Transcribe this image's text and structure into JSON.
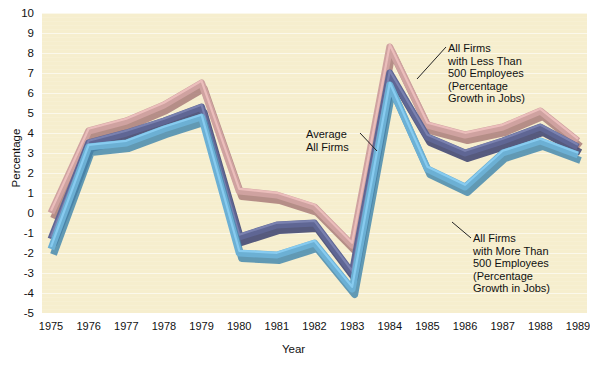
{
  "chart_data": {
    "type": "line",
    "title": "",
    "xlabel": "Year",
    "ylabel": "Percentage",
    "grid": true,
    "legend_position": "inline-annotations",
    "categories": [
      1975,
      1976,
      1977,
      1978,
      1979,
      1980,
      1981,
      1982,
      1983,
      1984,
      1985,
      1986,
      1987,
      1988,
      1989
    ],
    "x": [
      "1975",
      "1976",
      "1977",
      "1978",
      "1979",
      "1980",
      "1981",
      "1982",
      "1983",
      "1984",
      "1985",
      "1986",
      "1987",
      "1988",
      "1989"
    ],
    "xlim": [
      1975,
      1989
    ],
    "ylim": [
      -5,
      10
    ],
    "yticks": [
      "10",
      "9",
      "8",
      "7",
      "6",
      "5",
      "4",
      "3",
      "2",
      "1",
      "0",
      "-1",
      "-2",
      "-3",
      "-4",
      "-5"
    ],
    "series": [
      {
        "name": "All Firms with Less Than 500 Employees (Percentage Growth in Jobs)",
        "color": "#cfa2a0",
        "values": [
          0.0,
          4.1,
          4.6,
          5.4,
          6.5,
          1.1,
          0.9,
          0.3,
          -1.6,
          8.3,
          4.4,
          3.9,
          4.3,
          5.1,
          3.6
        ]
      },
      {
        "name": "Average All Firms",
        "color": "#5f6694",
        "values": [
          -1.3,
          3.5,
          4.0,
          4.6,
          5.3,
          -1.2,
          -0.6,
          -0.5,
          -3.0,
          7.0,
          3.8,
          3.0,
          3.6,
          4.3,
          3.3
        ]
      },
      {
        "name": "All Firms with More Than 500 Employees (Percentage Growth in Jobs)",
        "color": "#6cb0d4",
        "values": [
          -1.8,
          3.3,
          3.5,
          4.2,
          4.8,
          -2.0,
          -2.1,
          -1.5,
          -3.8,
          6.4,
          2.2,
          1.3,
          3.0,
          3.6,
          2.9
        ]
      }
    ]
  },
  "annotations": {
    "small_firms": "All Firms\nwith Less Than\n500 Employees\n(Percentage\nGrowth in Jobs)",
    "average": "Average\nAll Firms",
    "large_firms": "All Firms\nwith More Than\n500 Employees\n(Percentage\nGrowth in Jobs)"
  },
  "colors": {
    "background": "#f6eece",
    "page": "#ffffff",
    "small_firms": "#cfa2a0",
    "average": "#5f6694",
    "large_firms": "#6cb0d4",
    "text": "#111111"
  }
}
